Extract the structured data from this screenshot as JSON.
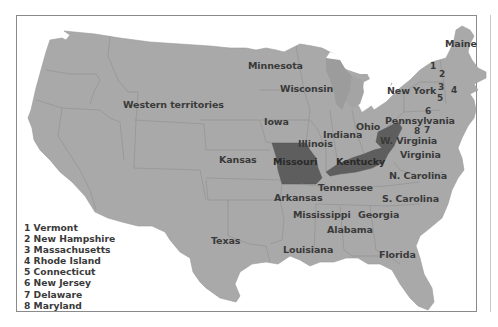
{
  "map": {
    "title": "",
    "colors": {
      "land": "#a9a9a9",
      "lakes": "#9c9c9c",
      "highlight": "#5e5e5e",
      "border_lines": "#8e8e8e",
      "label_text": "#3a3a3a",
      "water": "#ffffff",
      "frame": "#8a8a8a"
    },
    "highlighted_states": [
      "Missouri",
      "Kentucky",
      "W. Virginia"
    ],
    "region_labels": {
      "western_territories": "Western territories",
      "minnesota": "Minnesota",
      "wisconsin": "Wisconsin",
      "iowa": "Iowa",
      "illinois": "Illinois",
      "indiana": "Indiana",
      "ohio": "Ohio",
      "kansas": "Kansas",
      "missouri": "Missouri",
      "kentucky": "Kentucky",
      "tennessee": "Tennessee",
      "arkansas": "Arkansas",
      "mississippi": "Mississippi",
      "alabama": "Alabama",
      "georgia": "Georgia",
      "louisiana": "Louisiana",
      "texas": "Texas",
      "florida": "Florida",
      "n_carolina": "N. Carolina",
      "s_carolina": "S. Carolina",
      "virginia": "Virginia",
      "w_virginia": "W. Virginia",
      "pennsylvania": "Pennsylvania",
      "new_york": "New York",
      "maine": "Maine"
    },
    "number_markers": [
      "1",
      "2",
      "3",
      "4",
      "5",
      "6",
      "7",
      "8"
    ]
  },
  "legend": {
    "items": [
      "1 Vermont",
      "2 New Hampshire",
      "3 Massachusetts",
      "4 Rhode Island",
      "5 Connecticut",
      "6 New Jersey",
      "7 Delaware",
      "8 Maryland"
    ]
  }
}
